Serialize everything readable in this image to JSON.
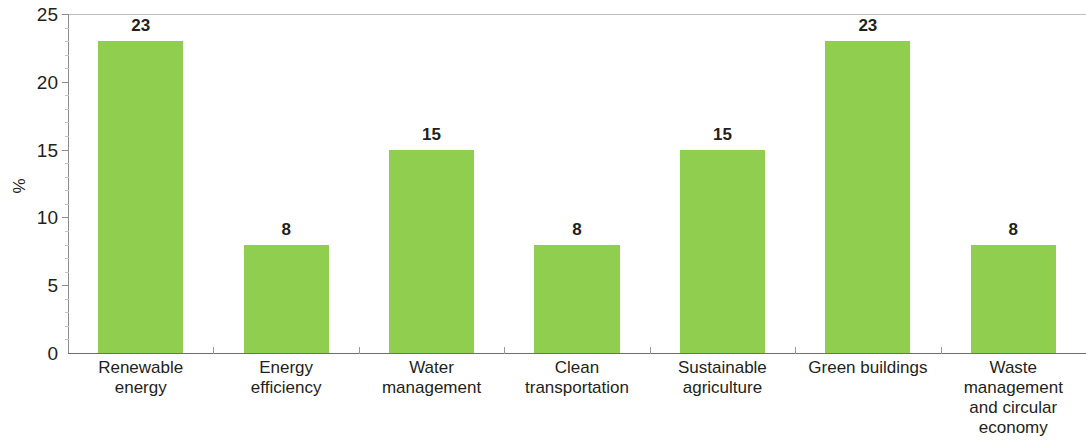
{
  "chart_data": {
    "type": "bar",
    "title": "",
    "xlabel": "",
    "ylabel": "%",
    "ylim": [
      0,
      25
    ],
    "ytick_step": 5,
    "yticks": [
      "0",
      "5",
      "10",
      "15",
      "20",
      "25"
    ],
    "grid": false,
    "legend": null,
    "bar_color": "#8fce4f",
    "categories": [
      "Renewable energy",
      "Energy efficiency",
      "Water management",
      "Clean transportation",
      "Sustainable agriculture",
      "Green buildings",
      "Waste management and circular economy"
    ],
    "category_lines": [
      [
        "Renewable",
        "energy"
      ],
      [
        "Energy",
        "efficiency"
      ],
      [
        "Water",
        "management"
      ],
      [
        "Clean",
        "transportation"
      ],
      [
        "Sustainable",
        "agriculture"
      ],
      [
        "Green buildings"
      ],
      [
        "Waste",
        "management",
        "and circular",
        "economy"
      ]
    ],
    "values": [
      23,
      8,
      15,
      8,
      15,
      23,
      8
    ],
    "value_labels": [
      "23",
      "8",
      "15",
      "8",
      "15",
      "23",
      "8"
    ]
  },
  "axis": {
    "y_title": "%"
  }
}
